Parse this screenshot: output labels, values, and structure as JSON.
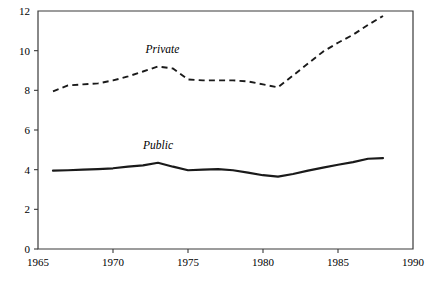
{
  "chart_data": {
    "type": "line",
    "title": "",
    "subtitle": "",
    "xlabel": "",
    "ylabel": "",
    "xlim": [
      1965,
      1990
    ],
    "ylim": [
      0,
      12
    ],
    "grid": false,
    "legend_position": "inline-annotation",
    "x_ticks": [
      1965,
      1970,
      1975,
      1980,
      1985,
      1990
    ],
    "x_tick_labels": [
      "1965",
      "1970",
      "1975",
      "1980",
      "1985",
      "1990"
    ],
    "y_ticks": [
      0,
      2,
      4,
      6,
      8,
      10,
      12
    ],
    "y_tick_labels": [
      "0",
      "2",
      "4",
      "6",
      "8",
      "10",
      "12"
    ],
    "x": [
      1966,
      1967,
      1968,
      1969,
      1970,
      1971,
      1972,
      1973,
      1974,
      1975,
      1976,
      1977,
      1978,
      1979,
      1980,
      1981,
      1982,
      1983,
      1984,
      1985,
      1986,
      1987,
      1988
    ],
    "series": [
      {
        "name": "Private",
        "style": "dashed",
        "label_x": 1973.3,
        "label_y": 9.9,
        "values": [
          7.95,
          8.25,
          8.3,
          8.35,
          8.5,
          8.7,
          8.95,
          9.2,
          9.1,
          8.55,
          8.5,
          8.5,
          8.5,
          8.45,
          8.3,
          8.15,
          8.75,
          9.35,
          9.95,
          10.4,
          10.8,
          11.3,
          11.75
        ]
      },
      {
        "name": "Public",
        "style": "solid",
        "label_x": 1973.0,
        "label_y": 5.05,
        "values": [
          3.95,
          3.97,
          4.0,
          4.03,
          4.07,
          4.15,
          4.22,
          4.35,
          4.15,
          3.97,
          4.0,
          4.03,
          3.97,
          3.85,
          3.72,
          3.65,
          3.78,
          3.95,
          4.1,
          4.25,
          4.38,
          4.55,
          4.58
        ]
      }
    ],
    "annotations": [
      {
        "text": "Private",
        "x": 1973.3,
        "y": 9.9
      },
      {
        "text": "Public",
        "x": 1973.0,
        "y": 5.05
      }
    ]
  }
}
